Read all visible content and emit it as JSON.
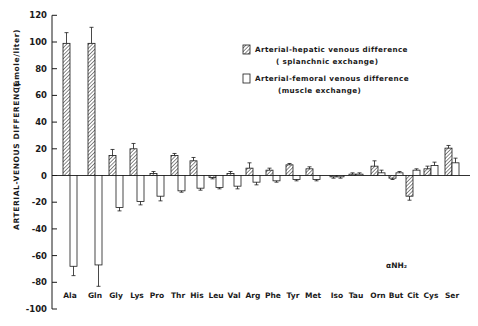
{
  "chart_data": {
    "type": "bar",
    "title": "",
    "xlabel": "",
    "ylabel": "ARTERIAL-VENOUS DIFFERENCE",
    "ylabel_units": "(µmole/liter)",
    "ylim": [
      -100,
      120
    ],
    "yticks": [
      120,
      100,
      80,
      60,
      40,
      20,
      0,
      -20,
      -40,
      -60,
      -80,
      -100
    ],
    "grid": false,
    "legend_position": "upper right",
    "categories": [
      "Ala",
      "Gln",
      "Gly",
      "Lys",
      "Pro",
      "Thr",
      "His",
      "Leu",
      "Val",
      "Arg",
      "Phe",
      "Tyr",
      "Met",
      "Iso",
      "Tau",
      "Orn",
      "But",
      "Cit",
      "Cys",
      "Ser"
    ],
    "category_annotations": {
      "But": "αNH2"
    },
    "series": [
      {
        "name": "Arterial-hepatic venous difference (splanchnic exchange)",
        "pattern": "hatched",
        "values": [
          99,
          99,
          15,
          20,
          1.5,
          15,
          11,
          -1.5,
          1.5,
          5.5,
          4,
          8,
          5,
          -1,
          1,
          7,
          -2,
          -15.5,
          5,
          20.5
        ],
        "error": [
          8,
          12,
          4.5,
          4,
          1.5,
          1.5,
          2.5,
          1,
          1.5,
          4,
          1.5,
          1,
          1.5,
          1,
          1,
          4,
          1,
          3,
          2,
          2
        ]
      },
      {
        "name": "Arterial-femoral venous difference (muscle exchange)",
        "pattern": "open",
        "values": [
          -68,
          -67,
          -24,
          -19.5,
          -15.5,
          -11.5,
          -9.5,
          -9,
          -8,
          -5,
          -4,
          -3,
          -3,
          -1,
          1,
          2,
          2,
          4,
          7.5,
          9.5
        ],
        "error": [
          7,
          16,
          2.5,
          2.5,
          3.5,
          1,
          1.5,
          1,
          2,
          2,
          1,
          1,
          1,
          1,
          1,
          2,
          1,
          1,
          2.5,
          3.5
        ]
      }
    ]
  },
  "legend": {
    "items": [
      {
        "line1": "Arterial-hepatic venous difference",
        "line2": "( splanchnic exchange)"
      },
      {
        "line1": "Arterial-femoral venous difference",
        "line2": "(muscle exchange)"
      }
    ]
  },
  "axis": {
    "ylabel": "ARTERIAL-VENOUS DIFFERENCE",
    "ylabel_units": "(µmole/liter)",
    "annotation": "αNH₂"
  }
}
